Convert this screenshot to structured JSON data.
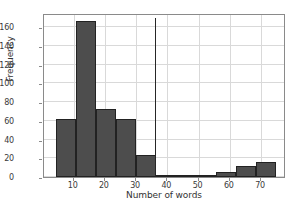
{
  "chart_data": {
    "type": "bar",
    "title": "",
    "xlabel": "Number of words",
    "ylabel": "Frequency",
    "xlim": [
      0.5,
      78
    ],
    "ylim": [
      0,
      175
    ],
    "grid": true,
    "legend": null,
    "bin_edges": [
      4.5,
      10.9,
      17.3,
      23.7,
      30.1,
      36.5,
      42.9,
      49.3,
      55.7,
      62.1,
      68.5,
      74.9
    ],
    "categories": [
      "4.5-10.9",
      "10.9-17.3",
      "17.3-23.7",
      "23.7-30.1",
      "30.1-36.5",
      "36.5-42.9",
      "42.9-49.3",
      "49.3-55.7",
      "55.7-62.1",
      "62.1-68.5",
      "68.5-74.9"
    ],
    "values": [
      62,
      166,
      73,
      62,
      24,
      2,
      1,
      1,
      5,
      12,
      16
    ],
    "xticks": [
      10,
      20,
      30,
      40,
      50,
      60,
      70
    ],
    "xtick_labels": [
      "10",
      "20",
      "30",
      "40",
      "50",
      "60",
      "70"
    ],
    "yticks": [
      0,
      20,
      40,
      60,
      80,
      100,
      120,
      140,
      160
    ],
    "ytick_labels": [
      "0",
      "20",
      "40",
      "60",
      "80",
      "100",
      "120",
      "140",
      "160"
    ],
    "annotations": [
      {
        "type": "vline",
        "x": 36,
        "value": 170,
        "label": ""
      }
    ],
    "colors": {
      "bar_face": "#4d4d4d",
      "bar_edge": "#222222",
      "grid": "#d9d9d9",
      "spine": "#8a8a8a",
      "text": "#333333",
      "background": "#ffffff"
    }
  }
}
